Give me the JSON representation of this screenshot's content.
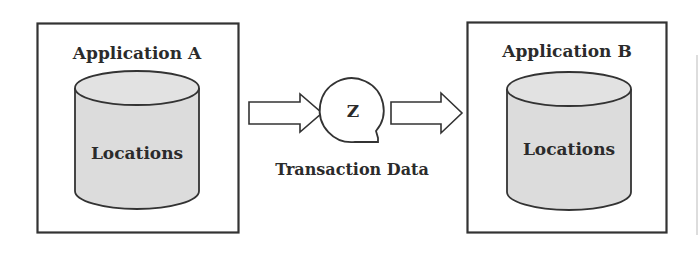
{
  "diagram": {
    "colors": {
      "stroke": "#333333",
      "cylinder_fill": "#dcdcdc",
      "background": "#ffffff"
    },
    "app_a": {
      "title": "Application A",
      "store_label": "Locations"
    },
    "app_b": {
      "title": "Application B",
      "store_label": "Locations"
    },
    "transfer": {
      "symbol": "Z",
      "caption": "Transaction Data"
    }
  }
}
